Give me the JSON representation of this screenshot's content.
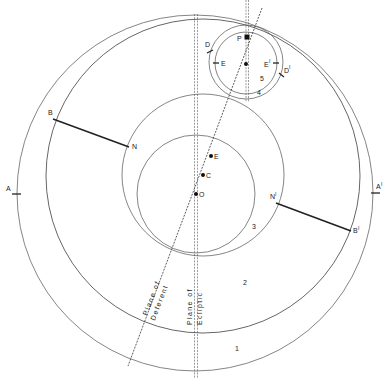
{
  "diagram": {
    "title": "",
    "labels": {
      "A": "A",
      "A_prime": "A",
      "B": "B",
      "B_prime": "B",
      "N": "N",
      "N_prime": "N",
      "O": "O",
      "C": "C",
      "E": "E",
      "P": "P",
      "D": "D",
      "D_prime": "D",
      "epi_E": "E",
      "epi_E_prime": "E",
      "prime_mark": "I"
    },
    "region_numbers": {
      "r1": "1",
      "r2": "2",
      "r3": "3",
      "r4": "4",
      "r5": "5"
    },
    "line_labels": {
      "deferent_line1": "Plane of",
      "deferent_line2": "Deferent",
      "ecliptic_line1": "Plane of",
      "ecliptic_line2": "Ecliptic"
    },
    "colors": {
      "stroke": "#555555",
      "ink": "#222222",
      "background": "#ffffff"
    }
  }
}
